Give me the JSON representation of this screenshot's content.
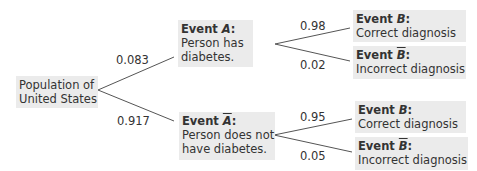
{
  "diagram": {
    "type": "tree_diagram",
    "root": {
      "label_line1": "Population of",
      "label_line2": "United States"
    },
    "level1": [
      {
        "prob": "0.083",
        "event_word": "Event ",
        "symbol": "A",
        "complement": false,
        "colon": ":",
        "desc_line1": "Person has",
        "desc_line2": "diabetes.",
        "children": [
          {
            "prob": "0.98",
            "event_word": "Event ",
            "symbol": "B",
            "complement": false,
            "colon": ":",
            "desc": "Correct diagnosis"
          },
          {
            "prob": "0.02",
            "event_word": "Event ",
            "symbol": "B",
            "complement": true,
            "colon": ":",
            "desc": "Incorrect diagnosis"
          }
        ]
      },
      {
        "prob": "0.917",
        "event_word": "Event ",
        "symbol": "A",
        "complement": true,
        "colon": ":",
        "desc_line1": "Person does not",
        "desc_line2": "have diabetes.",
        "children": [
          {
            "prob": "0.95",
            "event_word": "Event ",
            "symbol": "B",
            "complement": false,
            "colon": ":",
            "desc": "Correct diagnosis"
          },
          {
            "prob": "0.05",
            "event_word": "Event ",
            "symbol": "B",
            "complement": true,
            "colon": ":",
            "desc": "Incorrect diagnosis"
          }
        ]
      }
    ]
  },
  "colors": {
    "box_fill": "#ebebeb",
    "line": "#555555",
    "text": "#333333"
  }
}
